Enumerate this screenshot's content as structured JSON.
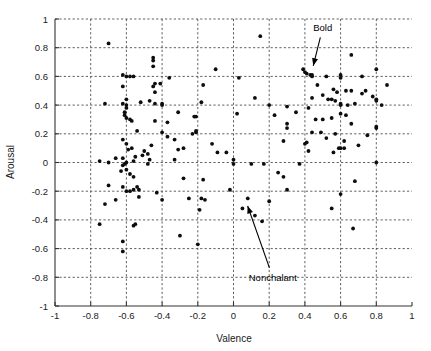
{
  "chart_data": {
    "type": "scatter",
    "title": "",
    "xlabel": "Valence",
    "ylabel": "Arousal",
    "xlim": [
      -1,
      1
    ],
    "ylim": [
      -1,
      1
    ],
    "grid": true,
    "legend_position": "none",
    "marker": "filled-circle",
    "marker_color": "#0d0d0d",
    "xticks": [
      "-1",
      "-0.8",
      "-0.6",
      "-0.4",
      "-0.2",
      "0",
      "0.2",
      "0.4",
      "0.6",
      "0.8",
      "1"
    ],
    "xtick_values": [
      -1,
      -0.8,
      -0.6,
      -0.4,
      -0.2,
      0,
      0.2,
      0.4,
      0.6,
      0.8,
      1
    ],
    "yticks": [
      "1",
      "0.8",
      "0.6",
      "0.4",
      "0.2",
      "0",
      "-0.2",
      "-0.4",
      "-0.6",
      "-0.8",
      "-1"
    ],
    "ytick_values": [
      1,
      0.8,
      0.6,
      0.4,
      0.2,
      0,
      -0.2,
      -0.4,
      -0.6,
      -0.8,
      -1
    ],
    "points": [
      [
        -0.7,
        0.83
      ],
      [
        -0.62,
        0.53
      ],
      [
        -0.62,
        0.61
      ],
      [
        -0.6,
        0.6
      ],
      [
        -0.58,
        0.6
      ],
      [
        -0.56,
        0.6
      ],
      [
        -0.45,
        0.73
      ],
      [
        -0.45,
        0.71
      ],
      [
        -0.45,
        0.67
      ],
      [
        -0.44,
        0.55
      ],
      [
        -0.45,
        0.53
      ],
      [
        -0.44,
        0.49
      ],
      [
        -0.44,
        0.41
      ],
      [
        -0.41,
        0.55
      ],
      [
        -0.4,
        0.41
      ],
      [
        -0.36,
        0.59
      ],
      [
        -0.31,
        0.35
      ],
      [
        -0.22,
        0.32
      ],
      [
        -0.21,
        0.32
      ],
      [
        -0.18,
        0.42
      ],
      [
        -0.17,
        0.54
      ],
      [
        -0.1,
        0.65
      ],
      [
        0.15,
        0.88
      ],
      [
        0.03,
        0.59
      ],
      [
        0.12,
        0.45
      ],
      [
        0.2,
        0.4
      ],
      [
        0.39,
        0.65
      ],
      [
        0.4,
        0.63
      ],
      [
        0.41,
        0.62
      ],
      [
        0.43,
        0.61
      ],
      [
        0.44,
        0.61
      ],
      [
        0.44,
        0.6
      ],
      [
        0.52,
        0.6
      ],
      [
        0.6,
        0.61
      ],
      [
        0.6,
        0.59
      ],
      [
        0.66,
        0.75
      ],
      [
        0.72,
        0.6
      ],
      [
        0.8,
        0.65
      ],
      [
        0.86,
        0.54
      ],
      [
        0.63,
        0.5
      ],
      [
        0.56,
        0.51
      ],
      [
        0.58,
        0.49
      ],
      [
        0.66,
        0.5
      ],
      [
        0.72,
        0.48
      ],
      [
        0.74,
        0.5
      ],
      [
        0.78,
        0.46
      ],
      [
        0.8,
        0.44
      ],
      [
        0.8,
        0.43
      ],
      [
        0.47,
        0.54
      ],
      [
        0.5,
        0.47
      ],
      [
        0.53,
        0.44
      ],
      [
        0.55,
        0.44
      ],
      [
        0.57,
        0.43
      ],
      [
        0.6,
        0.41
      ],
      [
        0.6,
        0.4
      ],
      [
        0.64,
        0.4
      ],
      [
        0.68,
        0.41
      ],
      [
        0.83,
        0.4
      ],
      [
        0.44,
        0.45
      ],
      [
        0.42,
        0.38
      ],
      [
        0.35,
        0.35
      ],
      [
        0.3,
        0.39
      ],
      [
        0.23,
        0.33
      ],
      [
        0.3,
        0.27
      ],
      [
        0.46,
        0.3
      ],
      [
        0.5,
        0.3
      ],
      [
        0.55,
        0.31
      ],
      [
        0.6,
        0.34
      ],
      [
        0.63,
        0.33
      ],
      [
        0.66,
        0.27
      ],
      [
        0.8,
        0.24
      ],
      [
        0.8,
        0.25
      ],
      [
        0.4,
        0.13
      ],
      [
        0.41,
        0.14
      ],
      [
        0.44,
        0.21
      ],
      [
        0.49,
        0.21
      ],
      [
        0.52,
        0.17
      ],
      [
        0.57,
        0.2
      ],
      [
        0.62,
        0.15
      ],
      [
        0.75,
        0.19
      ],
      [
        0.56,
        0.07
      ],
      [
        0.59,
        0.1
      ],
      [
        0.6,
        0.1
      ],
      [
        0.62,
        0.1
      ],
      [
        0.7,
        0.12
      ],
      [
        0.8,
        0.0
      ],
      [
        0.68,
        -0.13
      ],
      [
        0.6,
        -0.22
      ],
      [
        0.55,
        -0.32
      ],
      [
        0.67,
        -0.46
      ],
      [
        0.3,
        0.24
      ],
      [
        0.28,
        0.15
      ],
      [
        0.02,
        0.34
      ],
      [
        0.0,
        0.02
      ],
      [
        -0.04,
        0.07
      ],
      [
        -0.09,
        0.07
      ],
      [
        -0.12,
        0.13
      ],
      [
        0.0,
        -0.01
      ],
      [
        0.1,
        -0.01
      ],
      [
        0.17,
        -0.01
      ],
      [
        0.2,
        -0.27
      ],
      [
        0.25,
        -0.07
      ],
      [
        0.28,
        -0.1
      ],
      [
        0.3,
        -0.19
      ],
      [
        0.08,
        -0.25
      ],
      [
        0.05,
        -0.32
      ],
      [
        0.12,
        -0.37
      ],
      [
        0.16,
        -0.41
      ],
      [
        -0.02,
        -0.19
      ],
      [
        -0.18,
        -0.25
      ],
      [
        -0.16,
        -0.26
      ],
      [
        -0.19,
        -0.33
      ],
      [
        -0.2,
        -0.57
      ],
      [
        -0.3,
        -0.51
      ],
      [
        -0.25,
        -0.25
      ],
      [
        -0.28,
        -0.11
      ],
      [
        -0.17,
        -0.12
      ],
      [
        -0.21,
        0.22
      ],
      [
        -0.23,
        0.2
      ],
      [
        -0.21,
        0.21
      ],
      [
        -0.28,
        0.1
      ],
      [
        -0.33,
        0.16
      ],
      [
        -0.37,
        0.28
      ],
      [
        -0.4,
        0.4
      ],
      [
        -0.44,
        0.29
      ],
      [
        -0.47,
        0.43
      ],
      [
        -0.52,
        0.42
      ],
      [
        -0.54,
        0.22
      ],
      [
        -0.57,
        0.29
      ],
      [
        -0.58,
        0.3
      ],
      [
        -0.6,
        0.31
      ],
      [
        -0.61,
        0.35
      ],
      [
        -0.61,
        0.33
      ],
      [
        -0.6,
        0.38
      ],
      [
        -0.6,
        0.4
      ],
      [
        -0.6,
        0.44
      ],
      [
        -0.62,
        0.41
      ],
      [
        -0.72,
        0.41
      ],
      [
        -0.62,
        0.16
      ],
      [
        -0.6,
        0.13
      ],
      [
        -0.59,
        0.09
      ],
      [
        -0.57,
        0.1
      ],
      [
        -0.55,
        0.04
      ],
      [
        -0.56,
        0.01
      ],
      [
        -0.6,
        0.0
      ],
      [
        -0.61,
        -0.01
      ],
      [
        -0.62,
        -0.02
      ],
      [
        -0.62,
        0.03
      ],
      [
        -0.63,
        -0.06
      ],
      [
        -0.66,
        0.03
      ],
      [
        -0.7,
        0.0
      ],
      [
        -0.75,
        0.01
      ],
      [
        -0.6,
        -0.05
      ],
      [
        -0.58,
        -0.08
      ],
      [
        -0.56,
        -0.1
      ],
      [
        -0.54,
        -0.17
      ],
      [
        -0.53,
        -0.19
      ],
      [
        -0.56,
        -0.19
      ],
      [
        -0.58,
        -0.2
      ],
      [
        -0.6,
        -0.2
      ],
      [
        -0.62,
        -0.17
      ],
      [
        -0.7,
        -0.16
      ],
      [
        -0.72,
        -0.29
      ],
      [
        -0.66,
        -0.26
      ],
      [
        -0.75,
        -0.43
      ],
      [
        -0.62,
        -0.62
      ],
      [
        -0.62,
        -0.55
      ],
      [
        -0.56,
        -0.44
      ],
      [
        -0.55,
        -0.43
      ],
      [
        -0.53,
        -0.24
      ],
      [
        -0.4,
        -0.26
      ],
      [
        -0.43,
        -0.21
      ],
      [
        -0.46,
        0.12
      ],
      [
        -0.4,
        0.21
      ],
      [
        -0.37,
        0.18
      ],
      [
        -0.33,
        0.02
      ],
      [
        -0.31,
        0.09
      ],
      [
        -0.47,
        0.02
      ],
      [
        -0.48,
        -0.01
      ],
      [
        -0.5,
        0.08
      ],
      [
        -0.51,
        0.05
      ],
      [
        -0.48,
        0.06
      ],
      [
        0.37,
        -0.01
      ],
      [
        0.42,
        0.08
      ]
    ],
    "annotations": [
      {
        "label": "Bold",
        "label_x": 0.5,
        "label_y": 0.94,
        "target_x": 0.44,
        "target_y": 0.64
      },
      {
        "label": "Nonchalant",
        "label_x": 0.22,
        "label_y": -0.8,
        "target_x": 0.07,
        "target_y": -0.27
      }
    ]
  },
  "axes": {
    "xlabel": "Valence",
    "ylabel": "Arousal"
  }
}
